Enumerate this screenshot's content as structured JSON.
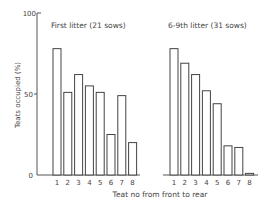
{
  "chart_data": [
    {
      "type": "bar",
      "title": "First litter (21 sows)",
      "categories": [
        "1",
        "2",
        "3",
        "4",
        "5",
        "6",
        "7",
        "8"
      ],
      "values": [
        78,
        51,
        62,
        55,
        51,
        25,
        49,
        20
      ],
      "xlabel": "Teat no from front to rear",
      "ylabel": "Teats occupied (%)",
      "ylim": [
        0,
        100
      ],
      "yticks": [
        0,
        50,
        100
      ],
      "grid": false
    },
    {
      "type": "bar",
      "title": "6-9th litter (31 sows)",
      "categories": [
        "1",
        "2",
        "3",
        "4",
        "5",
        "6",
        "7",
        "8"
      ],
      "values": [
        78,
        69,
        62,
        52,
        44,
        18,
        17,
        1
      ],
      "xlabel": "Teat no from front to rear",
      "ylabel": "Teats occupied (%)",
      "ylim": [
        0,
        100
      ],
      "yticks": [
        0,
        50,
        100
      ],
      "grid": false
    }
  ],
  "labels": {
    "ylabel": "Teats occupied (%)",
    "xlabel": "Teat no from front to rear",
    "ytick_0": "0",
    "ytick_50": "50",
    "ytick_100": "100",
    "panel_left_title": "First litter (21 sows)",
    "panel_right_title": "6-9th litter (31 sows)"
  }
}
